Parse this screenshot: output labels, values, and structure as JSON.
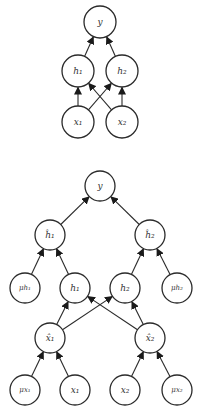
{
  "diagrams": [
    {
      "name": "simple-network",
      "radius": 16,
      "nodes": [
        {
          "id": "y",
          "label": "y",
          "cx": 100,
          "cy": 22
        },
        {
          "id": "h1",
          "label": "h₁",
          "cx": 78,
          "cy": 71
        },
        {
          "id": "h2",
          "label": "h₂",
          "cx": 122,
          "cy": 71
        },
        {
          "id": "x1",
          "label": "x₁",
          "cx": 78,
          "cy": 122
        },
        {
          "id": "x2",
          "label": "x₂",
          "cx": 122,
          "cy": 122
        }
      ],
      "edges": [
        {
          "from": "h1",
          "to": "y"
        },
        {
          "from": "h2",
          "to": "y"
        },
        {
          "from": "x1",
          "to": "h1"
        },
        {
          "from": "x1",
          "to": "h2"
        },
        {
          "from": "x2",
          "to": "h1"
        },
        {
          "from": "x2",
          "to": "h2"
        }
      ]
    },
    {
      "name": "noisy-network",
      "radius": 15,
      "nodes": [
        {
          "id": "y",
          "label": "y",
          "cx": 100,
          "cy": 186
        },
        {
          "id": "hhat1",
          "label": "ĥ₁",
          "cx": 50,
          "cy": 235
        },
        {
          "id": "hhat2",
          "label": "ĥ₂",
          "cx": 150,
          "cy": 235
        },
        {
          "id": "mu_h1",
          "label": "μh₁",
          "cx": 25,
          "cy": 288,
          "small": true
        },
        {
          "id": "h1",
          "label": "h₁",
          "cx": 75,
          "cy": 288
        },
        {
          "id": "h2",
          "label": "h₂",
          "cx": 125,
          "cy": 288
        },
        {
          "id": "mu_h2",
          "label": "μh₂",
          "cx": 177,
          "cy": 288,
          "small": true
        },
        {
          "id": "xhat1",
          "label": "x̂₁",
          "cx": 50,
          "cy": 338
        },
        {
          "id": "xhat2",
          "label": "x̂₂",
          "cx": 150,
          "cy": 338
        },
        {
          "id": "mu_x1",
          "label": "μx₁",
          "cx": 25,
          "cy": 390,
          "small": true
        },
        {
          "id": "x1",
          "label": "x₁",
          "cx": 75,
          "cy": 390
        },
        {
          "id": "x2",
          "label": "x₂",
          "cx": 125,
          "cy": 390
        },
        {
          "id": "mu_x2",
          "label": "μx₂",
          "cx": 177,
          "cy": 390,
          "small": true
        }
      ],
      "edges": [
        {
          "from": "hhat1",
          "to": "y"
        },
        {
          "from": "hhat2",
          "to": "y"
        },
        {
          "from": "mu_h1",
          "to": "hhat1"
        },
        {
          "from": "h1",
          "to": "hhat1"
        },
        {
          "from": "h2",
          "to": "hhat2"
        },
        {
          "from": "mu_h2",
          "to": "hhat2"
        },
        {
          "from": "xhat1",
          "to": "h1"
        },
        {
          "from": "xhat1",
          "to": "h2"
        },
        {
          "from": "xhat2",
          "to": "h1"
        },
        {
          "from": "xhat2",
          "to": "h2"
        },
        {
          "from": "mu_x1",
          "to": "xhat1"
        },
        {
          "from": "x1",
          "to": "xhat1"
        },
        {
          "from": "x2",
          "to": "xhat2"
        },
        {
          "from": "mu_x2",
          "to": "xhat2"
        }
      ]
    }
  ],
  "colors": {
    "stroke": "#2a2a2a",
    "label": "#333333",
    "background": "#ffffff"
  }
}
